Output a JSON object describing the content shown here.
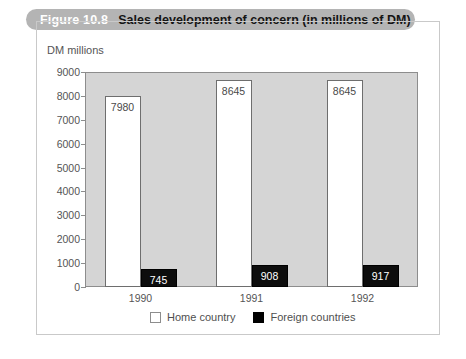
{
  "figure": {
    "number": "Figure 10.8",
    "title": "Sales development of concern (in millions of DM)"
  },
  "legend": {
    "position": "bottom-center",
    "entries": [
      {
        "label": "Home country",
        "swatch": "white-square-icon",
        "color": "#ffffff"
      },
      {
        "label": "Foreign countries",
        "swatch": "black-square-icon",
        "color": "#000000"
      }
    ]
  },
  "axes": {
    "y_title": "DM millions",
    "y_ticks": [
      "9000",
      "8000",
      "7000",
      "6000",
      "5000",
      "4000",
      "3000",
      "2000",
      "1000",
      "0"
    ],
    "x_ticks": [
      "1990",
      "1991",
      "1992"
    ]
  },
  "colors": {
    "header_band": "#b4b4b4",
    "header_number_text": "#ffffff",
    "header_title_text": "#141414",
    "plot_background": "#d5d5d5",
    "frame_border": "#c9c9c9",
    "axis_line": "#8d8d8d",
    "home_bar": "#ffffff",
    "foreign_bar": "#000000",
    "tick_text": "#555555"
  },
  "chart_data": {
    "type": "bar",
    "title": "Sales development of concern (in millions of DM)",
    "xlabel": "",
    "ylabel": "DM millions",
    "ylim": [
      0,
      9000
    ],
    "ytick_step": 1000,
    "grid": false,
    "legend_position": "bottom-center",
    "categories": [
      "1990",
      "1991",
      "1992"
    ],
    "series": [
      {
        "name": "Home country",
        "values": [
          7980,
          8645,
          8645
        ],
        "color": "#ffffff"
      },
      {
        "name": "Foreign countries",
        "values": [
          745,
          908,
          917
        ],
        "color": "#000000"
      }
    ],
    "data_labels": {
      "Home country": [
        "7980",
        "8645",
        "8645"
      ],
      "Foreign countries": [
        "745",
        "908",
        "917"
      ]
    }
  }
}
